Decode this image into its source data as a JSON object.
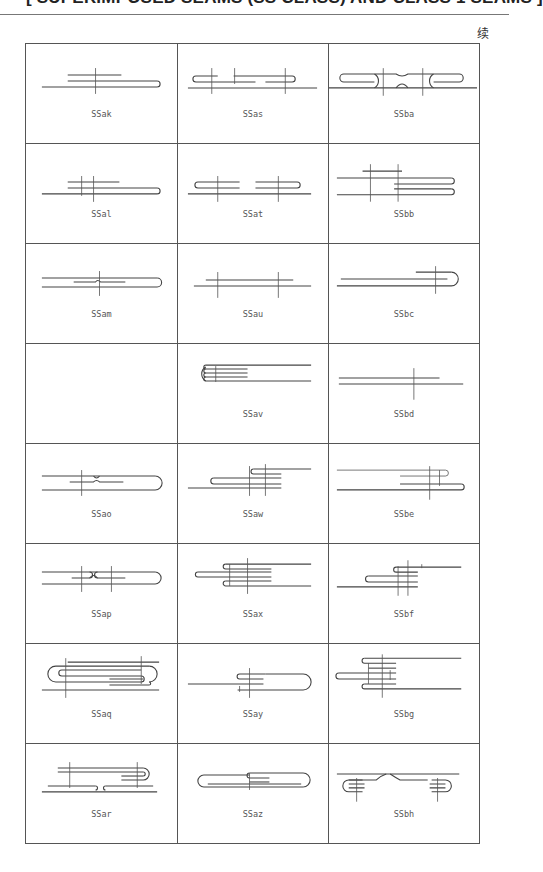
{
  "header": {
    "title": "[ SUPERIMPOSED SEAMS (SS CLASS) AND CLASS 1 SEAMS ]",
    "continued_marker": "续"
  },
  "table": {
    "columns": 3,
    "rows": [
      [
        "SSak",
        "SSas",
        "SSba"
      ],
      [
        "SSal",
        "SSat",
        "SSbb"
      ],
      [
        "SSam",
        "SSau",
        "SSbc"
      ],
      [
        "",
        "SSav",
        "SSbd"
      ],
      [
        "SSao",
        "SSaw",
        "SSbe"
      ],
      [
        "SSap",
        "SSax",
        "SSbf"
      ],
      [
        "SSaq",
        "SSay",
        "SSbg"
      ],
      [
        "SSar",
        "SSaz",
        "SSbh"
      ]
    ]
  },
  "cells": {
    "r0c0": "SSak",
    "r0c1": "SSas",
    "r0c2": "SSba",
    "r1c0": "SSal",
    "r1c1": "SSat",
    "r1c2": "SSbb",
    "r2c0": "SSam",
    "r2c1": "SSau",
    "r2c2": "SSbc",
    "r3c0": "",
    "r3c1": "SSav",
    "r3c2": "SSbd",
    "r4c0": "SSao",
    "r4c1": "SSaw",
    "r4c2": "SSbe",
    "r5c0": "SSap",
    "r5c1": "SSax",
    "r5c2": "SSbf",
    "r6c0": "SSaq",
    "r6c1": "SSay",
    "r6c2": "SSbg",
    "r7c0": "SSar",
    "r7c1": "SSaz",
    "r7c2": "SSbh"
  }
}
